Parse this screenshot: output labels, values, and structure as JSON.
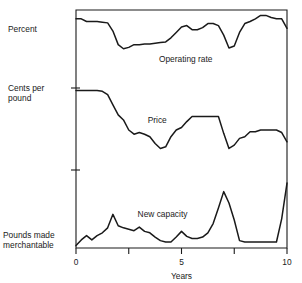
{
  "chart_data": {
    "type": "line",
    "title": "",
    "subtitle": "",
    "xlabel": "Years",
    "ylabel": "",
    "xlim": [
      0,
      10
    ],
    "grid": false,
    "legend_position": "inline-annotations",
    "axis_style": "open-frame, three stacked panels sharing one x-axis",
    "x_ticks": [
      0,
      2.5,
      5,
      7.5,
      10
    ],
    "x_tick_labels": [
      "0",
      "",
      "5",
      "",
      "10"
    ],
    "left_axis_labels": [
      {
        "text": "Percent",
        "panel": "operating-rate"
      },
      {
        "text": "Cents per pound",
        "panel": "price"
      },
      {
        "text": "Pounds made merchantable",
        "panel": "new-capacity"
      }
    ],
    "y_tick_marks_unlabeled": 3,
    "series": [
      {
        "name": "Operating rate",
        "panel": "top",
        "units": "Percent",
        "label_x": 5.2,
        "label_y": 0.26,
        "x": [
          0.0,
          0.25,
          0.5,
          0.75,
          1.0,
          1.25,
          1.5,
          1.75,
          2.0,
          2.25,
          2.5,
          2.75,
          3.0,
          3.25,
          3.5,
          3.75,
          4.0,
          4.25,
          4.5,
          4.75,
          5.0,
          5.25,
          5.5,
          5.75,
          6.0,
          6.25,
          6.5,
          6.75,
          7.0,
          7.25,
          7.5,
          7.75,
          8.0,
          8.25,
          8.5,
          8.75,
          9.0,
          9.25,
          9.5,
          9.75,
          10.0
        ],
        "values": [
          0.9,
          0.9,
          0.86,
          0.86,
          0.86,
          0.85,
          0.84,
          0.72,
          0.52,
          0.46,
          0.48,
          0.52,
          0.52,
          0.53,
          0.53,
          0.54,
          0.55,
          0.56,
          0.62,
          0.7,
          0.78,
          0.8,
          0.74,
          0.74,
          0.77,
          0.83,
          0.83,
          0.8,
          0.66,
          0.47,
          0.5,
          0.7,
          0.83,
          0.86,
          0.9,
          0.95,
          0.95,
          0.92,
          0.9,
          0.9,
          0.76
        ]
      },
      {
        "name": "Price",
        "panel": "middle",
        "units": "Cents per pound",
        "label_x": 3.85,
        "label_y": 0.58,
        "x": [
          0.0,
          0.25,
          0.5,
          0.75,
          1.0,
          1.25,
          1.5,
          1.75,
          2.0,
          2.25,
          2.5,
          2.75,
          3.0,
          3.25,
          3.5,
          3.75,
          4.0,
          4.25,
          4.5,
          4.75,
          5.0,
          5.25,
          5.5,
          5.75,
          6.0,
          6.25,
          6.5,
          6.75,
          7.0,
          7.25,
          7.5,
          7.75,
          8.0,
          8.25,
          8.5,
          8.75,
          9.0,
          9.25,
          9.5,
          9.75,
          10.0
        ],
        "values": [
          0.97,
          0.97,
          0.97,
          0.97,
          0.97,
          0.96,
          0.92,
          0.8,
          0.68,
          0.62,
          0.5,
          0.45,
          0.47,
          0.45,
          0.42,
          0.34,
          0.28,
          0.3,
          0.42,
          0.5,
          0.53,
          0.6,
          0.66,
          0.66,
          0.66,
          0.66,
          0.66,
          0.66,
          0.46,
          0.28,
          0.32,
          0.4,
          0.42,
          0.48,
          0.48,
          0.5,
          0.5,
          0.5,
          0.5,
          0.47,
          0.36
        ]
      },
      {
        "name": "New capacity",
        "panel": "bottom",
        "units": "Pounds made merchantable",
        "label_x": 4.1,
        "label_y": 0.42,
        "x": [
          0.0,
          0.25,
          0.5,
          0.75,
          1.0,
          1.25,
          1.5,
          1.75,
          2.0,
          2.25,
          2.5,
          2.75,
          3.0,
          3.25,
          3.5,
          3.75,
          4.0,
          4.25,
          4.5,
          4.75,
          5.0,
          5.25,
          5.5,
          5.75,
          6.0,
          6.25,
          6.5,
          6.75,
          7.0,
          7.25,
          7.5,
          7.75,
          8.0,
          8.25,
          8.5,
          8.75,
          9.0,
          9.25,
          9.5,
          9.75,
          10.0
        ],
        "values": [
          0.02,
          0.1,
          0.16,
          0.1,
          0.16,
          0.2,
          0.27,
          0.46,
          0.3,
          0.27,
          0.25,
          0.23,
          0.28,
          0.22,
          0.2,
          0.14,
          0.09,
          0.07,
          0.07,
          0.14,
          0.22,
          0.15,
          0.12,
          0.12,
          0.14,
          0.2,
          0.33,
          0.55,
          0.78,
          0.62,
          0.38,
          0.09,
          0.07,
          0.07,
          0.07,
          0.07,
          0.07,
          0.07,
          0.07,
          0.4,
          0.9
        ]
      }
    ]
  },
  "axis": {
    "x_title": "Years",
    "x_tick_0": "0",
    "x_tick_5": "5",
    "x_tick_10": "10"
  },
  "labels": {
    "percent": "Percent",
    "cents_line1": "Cents per",
    "cents_line2": "pound",
    "pounds_line1": "Pounds made",
    "pounds_line2": "merchantable",
    "operating_rate": "Operating rate",
    "price": "Price",
    "new_capacity": "New capacity"
  },
  "colors": {
    "line": "#1a1a1a",
    "background": "#ffffff"
  }
}
